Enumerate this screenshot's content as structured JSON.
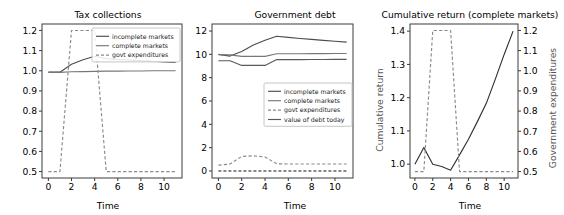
{
  "figure": {
    "width": 564,
    "height": 215,
    "background": "#ffffff"
  },
  "colors": {
    "incomplete_markets": "#4d4d4d",
    "complete_markets": "#777777",
    "govt_expenditures": "#8a8a8a",
    "value_of_debt_today": "#5a5a5a",
    "cumulative_return": "#333333",
    "axis": "#3a3a3a",
    "right_axis_label": "#555555"
  },
  "panels": [
    {
      "id": "tax-collections",
      "title": "Tax collections",
      "xlabel": "Time",
      "ylabel": "",
      "xticks": [
        "0",
        "2",
        "4",
        "6",
        "8",
        "10"
      ],
      "yticks": [
        "0.5",
        "0.6",
        "0.7",
        "0.8",
        "0.9",
        "1.0",
        "1.1",
        "1.2"
      ],
      "legend": [
        "incomplete markets",
        "complete markets",
        "govt expenditures"
      ]
    },
    {
      "id": "government-debt",
      "title": "Government debt",
      "xlabel": "Time",
      "ylabel": "",
      "xticks": [
        "0",
        "2",
        "4",
        "6",
        "8",
        "10"
      ],
      "yticks": [
        "0",
        "2",
        "4",
        "6",
        "8",
        "10",
        "12"
      ],
      "legend": [
        "incomplete markets",
        "complete markets",
        "govt expenditures",
        "value of debt today"
      ]
    },
    {
      "id": "cumulative-return",
      "title": "Cumulative return (complete markets)",
      "xlabel": "Time",
      "ylabel": "Cumulative return",
      "ylabel_right": "Government expenditures",
      "xticks": [
        "0",
        "2",
        "4",
        "6",
        "8",
        "10"
      ],
      "yticks": [
        "1.0",
        "1.1",
        "1.2",
        "1.3",
        "1.4"
      ],
      "yticks_right": [
        "0.5",
        "0.6",
        "0.7",
        "0.8",
        "0.9",
        "1.0",
        "1.1",
        "1.2"
      ],
      "legend": []
    }
  ],
  "chart_data": [
    {
      "type": "line",
      "title": "Tax collections",
      "xlabel": "Time",
      "ylabel": "",
      "xlim": [
        -0.55,
        11.55
      ],
      "ylim": [
        0.468,
        1.232
      ],
      "grid": false,
      "legend_position": "upper right",
      "x": [
        0,
        1,
        2,
        3,
        4,
        5,
        6,
        7,
        8,
        9,
        10,
        11
      ],
      "series": [
        {
          "name": "incomplete markets",
          "style": "solid",
          "values": [
            0.993,
            0.993,
            1.032,
            1.055,
            1.072,
            1.06,
            1.056,
            1.053,
            1.05,
            1.047,
            1.044,
            1.041
          ]
        },
        {
          "name": "complete markets",
          "style": "solid",
          "values": [
            0.992,
            0.992,
            0.995,
            0.996,
            0.997,
            0.998,
            0.998,
            0.999,
            0.999,
            1.0,
            1.0,
            1.0
          ]
        },
        {
          "name": "govt expenditures",
          "style": "dashed",
          "values": [
            0.5,
            0.5,
            1.2,
            1.2,
            1.2,
            0.5,
            0.5,
            0.5,
            0.5,
            0.5,
            0.5,
            0.5
          ]
        }
      ]
    },
    {
      "type": "line",
      "title": "Government debt",
      "xlabel": "Time",
      "ylabel": "",
      "xlim": [
        -0.55,
        11.55
      ],
      "ylim": [
        -0.6,
        12.6
      ],
      "grid": false,
      "legend_position": "center right",
      "x": [
        0,
        1,
        2,
        3,
        4,
        5,
        6,
        7,
        8,
        9,
        10,
        11
      ],
      "series": [
        {
          "name": "incomplete markets",
          "style": "solid",
          "values": [
            10.0,
            9.85,
            10.25,
            10.8,
            11.2,
            11.55,
            11.45,
            11.36,
            11.28,
            11.2,
            11.12,
            11.05
          ]
        },
        {
          "name": "complete markets",
          "style": "solid",
          "values": [
            9.98,
            9.95,
            9.82,
            9.82,
            9.82,
            10.05,
            10.05,
            10.05,
            10.06,
            10.06,
            10.07,
            10.07
          ]
        },
        {
          "name": "value of debt today",
          "style": "solid",
          "values": [
            9.45,
            9.45,
            9.05,
            9.05,
            9.05,
            9.55,
            9.55,
            9.55,
            9.56,
            9.56,
            9.57,
            9.57
          ]
        },
        {
          "name": "govt expenditures",
          "style": "dashed",
          "values": [
            0.5,
            0.6,
            1.25,
            1.3,
            1.2,
            0.62,
            0.6,
            0.6,
            0.6,
            0.6,
            0.6,
            0.6
          ]
        },
        {
          "name": "zero line",
          "style": "dashed",
          "values": [
            0,
            0,
            0,
            0,
            0,
            0,
            0,
            0,
            0,
            0,
            0,
            0
          ]
        }
      ]
    },
    {
      "type": "line",
      "title": "Cumulative return (complete markets)",
      "xlabel": "Time",
      "ylabel": "Cumulative return",
      "ylabel_right": "Government expenditures",
      "xlim": [
        -0.55,
        11.55
      ],
      "ylim": [
        0.9585,
        1.4215
      ],
      "ylim_right": [
        0.468,
        1.232
      ],
      "grid": false,
      "legend_position": "none",
      "x": [
        0,
        1,
        2,
        3,
        4,
        5,
        6,
        7,
        8,
        9,
        10,
        11
      ],
      "series": [
        {
          "name": "cumulative return",
          "style": "solid",
          "axis": "left",
          "values": [
            1.0,
            1.05,
            1.0,
            0.993,
            0.982,
            1.028,
            1.075,
            1.128,
            1.183,
            1.255,
            1.33,
            1.4
          ]
        },
        {
          "name": "govt expenditures",
          "style": "dashed",
          "axis": "right",
          "values": [
            0.5,
            0.5,
            1.2,
            1.2,
            1.2,
            0.5,
            0.5,
            0.5,
            0.5,
            0.5,
            0.5,
            0.5
          ]
        }
      ]
    }
  ]
}
